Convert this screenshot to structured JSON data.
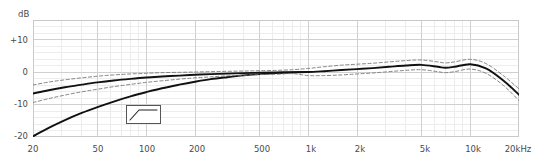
{
  "chart_data": {
    "type": "line",
    "title": "",
    "xlabel": "",
    "ylabel": "dB",
    "xscale": "log",
    "xlim": [
      20,
      20000
    ],
    "ylim": [
      -20,
      16
    ],
    "grid": true,
    "legend": "none",
    "y_ticks": [
      "+10",
      "0",
      "-10",
      "-20"
    ],
    "y_tick_values": [
      10,
      0,
      -10,
      -20
    ],
    "x_ticks": [
      "20",
      "50",
      "100",
      "200",
      "500",
      "1k",
      "2k",
      "5k",
      "10k",
      "20kHz"
    ],
    "x_tick_values": [
      20,
      50,
      100,
      200,
      500,
      1000,
      2000,
      5000,
      10000,
      20000
    ],
    "series": [
      {
        "name": "response-flat",
        "style": "solid",
        "color": "#111111",
        "x": [
          20,
          25,
          31.5,
          40,
          50,
          63,
          80,
          100,
          125,
          160,
          200,
          250,
          315,
          400,
          500,
          630,
          800,
          1000,
          1250,
          1600,
          2000,
          2500,
          3150,
          4000,
          5000,
          6300,
          7000,
          8000,
          10000,
          12500,
          16000,
          20000
        ],
        "y": [
          -6.6,
          -5.6,
          -4.7,
          -3.9,
          -3.2,
          -2.6,
          -2.1,
          -1.7,
          -1.4,
          -1.1,
          -0.85,
          -0.65,
          -0.5,
          -0.35,
          -0.2,
          -0.1,
          -0.05,
          0.0,
          0.25,
          0.6,
          0.9,
          1.2,
          1.6,
          2.0,
          2.2,
          1.6,
          1.3,
          1.6,
          2.4,
          1.1,
          -2.6,
          -7.0
        ]
      },
      {
        "name": "response-lowcut",
        "style": "solid",
        "color": "#111111",
        "x": [
          20,
          25,
          31.5,
          40,
          50,
          63,
          80,
          100,
          125,
          160,
          200,
          250,
          315,
          400,
          500,
          630,
          800,
          1000
        ],
        "y": [
          -19.8,
          -17.2,
          -14.8,
          -12.6,
          -10.8,
          -9.1,
          -7.5,
          -6.2,
          -5.0,
          -3.9,
          -3.0,
          -2.2,
          -1.6,
          -1.05,
          -0.65,
          -0.35,
          -0.15,
          0.0
        ]
      },
      {
        "name": "tolerance-upper",
        "style": "dashed",
        "color": "#777777",
        "x": [
          20,
          25,
          31.5,
          40,
          50,
          63,
          80,
          100,
          125,
          160,
          200,
          250,
          315,
          400,
          500,
          630,
          800,
          1000,
          1250,
          1600,
          2000,
          2500,
          3150,
          4000,
          5000,
          6300,
          7000,
          8000,
          10000,
          12500,
          16000,
          20000
        ],
        "y": [
          -4.0,
          -3.1,
          -2.4,
          -1.8,
          -1.3,
          -0.9,
          -0.6,
          -0.4,
          -0.2,
          -0.1,
          0.0,
          0.1,
          0.2,
          0.3,
          0.4,
          0.5,
          0.7,
          1.1,
          1.6,
          2.1,
          2.4,
          2.7,
          3.1,
          3.5,
          3.7,
          3.1,
          2.8,
          3.1,
          3.9,
          2.6,
          -1.1,
          -5.2
        ]
      },
      {
        "name": "tolerance-lower",
        "style": "dashed",
        "color": "#777777",
        "x": [
          20,
          25,
          31.5,
          40,
          50,
          63,
          80,
          100,
          125,
          160,
          200,
          250,
          315,
          400,
          500,
          630,
          800,
          1000,
          1250,
          1600,
          2000,
          2500,
          3150,
          4000,
          5000,
          6300,
          7000,
          8000,
          10000,
          12500,
          16000,
          20000
        ],
        "y": [
          -9.4,
          -8.2,
          -7.1,
          -6.1,
          -5.3,
          -4.5,
          -3.8,
          -3.2,
          -2.7,
          -2.2,
          -1.8,
          -1.5,
          -1.2,
          -1.0,
          -0.8,
          -0.7,
          -0.5,
          -1.1,
          -1.1,
          -0.9,
          -0.6,
          -0.3,
          0.1,
          0.5,
          0.7,
          0.1,
          -0.2,
          0.1,
          0.9,
          -0.4,
          -4.1,
          -8.8
        ]
      }
    ],
    "annotations": [
      {
        "name": "filter-symbol",
        "kind": "low-cut-filter-icon",
        "x_px": 126,
        "y_px": 105,
        "w_px": 35,
        "h_px": 19
      }
    ]
  },
  "axes": {
    "y_unit": "dB",
    "y_ticks": [
      {
        "label": "+10",
        "value": 10
      },
      {
        "label": "0",
        "value": 0
      },
      {
        "label": "-10",
        "value": -10
      },
      {
        "label": "-20",
        "value": -20
      }
    ],
    "x_ticks": [
      {
        "label": "20",
        "value": 20
      },
      {
        "label": "50",
        "value": 50
      },
      {
        "label": "100",
        "value": 100
      },
      {
        "label": "200",
        "value": 200
      },
      {
        "label": "500",
        "value": 500
      },
      {
        "label": "1k",
        "value": 1000
      },
      {
        "label": "2k",
        "value": 2000
      },
      {
        "label": "5k",
        "value": 5000
      },
      {
        "label": "10k",
        "value": 10000
      },
      {
        "label": "20kHz",
        "value": 20000
      }
    ]
  },
  "colors": {
    "background": "#ffffff",
    "frame": "#c9c9c9",
    "grid_minor": "#ededed",
    "grid_major": "#d0d0d0",
    "curve": "#111111",
    "tolerance": "#6f6f6f",
    "text": "#4a4a4a",
    "icon_border": "#555555"
  }
}
